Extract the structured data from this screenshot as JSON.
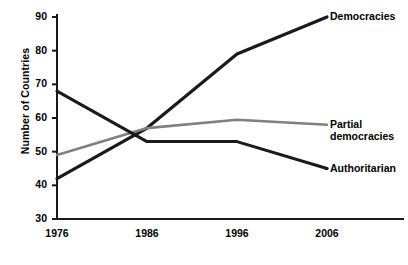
{
  "chart_data": {
    "type": "line",
    "title": "",
    "xlabel": "",
    "ylabel": "Number of Countries",
    "categories": [
      "1976",
      "1986",
      "1996",
      "2006"
    ],
    "x": [
      1976,
      1986,
      1996,
      2006
    ],
    "xlim": [
      1976,
      2006
    ],
    "ylim": [
      30,
      90
    ],
    "yticks": [
      30,
      40,
      50,
      60,
      70,
      80,
      90
    ],
    "ytick_labels": [
      "30",
      "40",
      "50",
      "60",
      "70",
      "80",
      "90"
    ],
    "xtick_labels": [
      "1976",
      "1986",
      "1996",
      "2006"
    ],
    "grid": false,
    "legend_position": "right-inline-labels",
    "series": [
      {
        "name": "Democracies",
        "label": "Democracies",
        "color": "#1a1a1a",
        "width": 3.2,
        "values": [
          42,
          57,
          79,
          90
        ]
      },
      {
        "name": "Partial democracies",
        "label": "Partial\ndemocracies",
        "label_line1": "Partial",
        "label_line2": "democracies",
        "color": "#808080",
        "width": 2.6,
        "values": [
          49,
          57,
          59.5,
          58
        ]
      },
      {
        "name": "Authoritarian",
        "label": "Authoritarian",
        "color": "#1a1a1a",
        "width": 3.0,
        "values": [
          68,
          53,
          53,
          45
        ]
      }
    ]
  },
  "axes": {
    "axis_color": "#1a1a1a"
  }
}
